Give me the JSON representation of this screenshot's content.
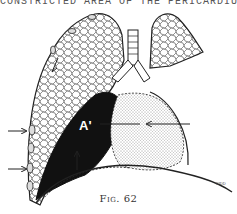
{
  "header": {
    "text": "CONSTRICTED AREA OF THE PERICARDIUM"
  },
  "figure": {
    "label_a": "A'",
    "signature": "KIDD",
    "caption": "Fig. 62",
    "colors": {
      "ink": "#222222",
      "fill_dark": "#111111",
      "paper": "#ffffff"
    }
  }
}
